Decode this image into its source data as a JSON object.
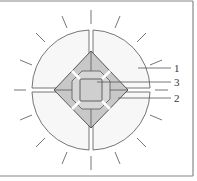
{
  "diagram": {
    "type": "schematic cross-section",
    "labels": [
      {
        "id": "1",
        "text": "1",
        "target": "outer circular segments"
      },
      {
        "id": "3",
        "text": "3",
        "target": "central square core"
      },
      {
        "id": "2",
        "text": "2",
        "target": "diamond facets"
      }
    ],
    "colors": {
      "line": "#555555",
      "diamond_fill": "#c8c8c8",
      "inner_fill": "#d8d8d8",
      "core_fill": "#cfcfcf",
      "background": "#ffffff",
      "frame": "#888888"
    },
    "ray_count": 16
  }
}
